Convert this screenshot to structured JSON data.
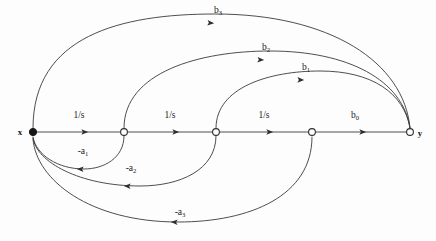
{
  "figure": {
    "kind": "signal-flow-graph",
    "background_color": "#fdfdfd",
    "stroke_color": "#3a3a3a",
    "text_color": "#1a1a1a"
  },
  "nodes": [
    {
      "id": "x",
      "label": "x",
      "style": "filled",
      "cx": 33,
      "cy": 132,
      "r": 3.6,
      "label_x": 20,
      "label_y": 135
    },
    {
      "id": "n2",
      "label": "",
      "style": "open",
      "cx": 124,
      "cy": 132,
      "r": 3.4,
      "label_x": 124,
      "label_y": 132
    },
    {
      "id": "n3",
      "label": "",
      "style": "open",
      "cx": 216,
      "cy": 132,
      "r": 3.4,
      "label_x": 216,
      "label_y": 132
    },
    {
      "id": "n4",
      "label": "",
      "style": "open",
      "cx": 312,
      "cy": 132,
      "r": 3.4,
      "label_x": 312,
      "label_y": 132
    },
    {
      "id": "y",
      "label": "y",
      "style": "open",
      "cx": 410,
      "cy": 132,
      "r": 3.4,
      "label_x": 420,
      "label_y": 136
    }
  ],
  "forward_edges": [
    {
      "id": "e-x-n2",
      "from": "x",
      "to": "n2",
      "label": "1/s",
      "label_sub": "",
      "label_x": 79,
      "label_y": 118,
      "arrow_x": 86,
      "arrow_y": 132
    },
    {
      "id": "e-n2-n3",
      "from": "n2",
      "to": "n3",
      "label": "1/s",
      "label_sub": "",
      "label_x": 170,
      "label_y": 118,
      "arrow_x": 177,
      "arrow_y": 132
    },
    {
      "id": "e-n3-n4",
      "from": "n3",
      "to": "n4",
      "label": "1/s",
      "label_sub": "",
      "label_x": 264,
      "label_y": 118,
      "arrow_x": 271,
      "arrow_y": 132
    },
    {
      "id": "e-n4-y",
      "from": "n4",
      "to": "y",
      "label": "b",
      "label_sub": "0",
      "label_x": 355,
      "label_y": 118,
      "arrow_x": 364,
      "arrow_y": 132
    }
  ],
  "feedforward_arcs": [
    {
      "id": "arc-b3",
      "from": "x",
      "to": "y",
      "label": "b",
      "label_sub": "3",
      "path": "M 33 128 C 33 36, 120 14, 215 14 C 330 14, 404 62, 410 128",
      "label_x": 218,
      "label_y": 13,
      "arrow_x": 212,
      "arrow_y": 23,
      "arrow_rot": 4
    },
    {
      "id": "arc-b2",
      "from": "n2",
      "to": "y",
      "label": "b",
      "label_sub": "2",
      "path": "M 124 128 C 124 72, 200 51, 270 51 C 348 51, 403 80, 410 128",
      "label_x": 266,
      "label_y": 50,
      "arrow_x": 262,
      "arrow_y": 60,
      "arrow_rot": 3
    },
    {
      "id": "arc-b1",
      "from": "n3",
      "to": "y",
      "label": "b",
      "label_sub": "1",
      "path": "M 216 128 C 216 87, 270 71, 320 71 C 372 71, 404 93, 410 128",
      "label_x": 306,
      "label_y": 70,
      "arrow_x": 302,
      "arrow_y": 80,
      "arrow_rot": 2
    }
  ],
  "feedback_arcs": [
    {
      "id": "arc-a1",
      "from": "n2",
      "to": "x",
      "label": "-a",
      "label_sub": "1",
      "path": "M 124 136 C 124 158, 104 169, 84 169 C 58 169, 36 155, 33 137",
      "label_x": 83,
      "label_y": 154,
      "arrow_x": 79,
      "arrow_y": 169,
      "arrow_rot": 183
    },
    {
      "id": "arc-a2",
      "from": "n3",
      "to": "x",
      "label": "-a",
      "label_sub": "2",
      "path": "M 216 136 C 216 170, 180 186, 140 186 C 80 186, 36 162, 33 138",
      "label_x": 131,
      "label_y": 171,
      "arrow_x": 126,
      "arrow_y": 186,
      "arrow_rot": 183
    },
    {
      "id": "arc-a3",
      "from": "n4",
      "to": "x",
      "label": "-a",
      "label_sub": "3",
      "path": "M 312 137 C 312 196, 250 222, 178 222 C 90 222, 36 180, 33 139",
      "label_x": 180,
      "label_y": 215,
      "arrow_x": 173,
      "arrow_y": 222,
      "arrow_rot": 183
    }
  ]
}
